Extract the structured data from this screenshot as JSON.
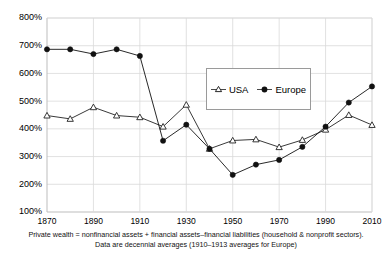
{
  "chart_data": {
    "type": "line",
    "title": "",
    "subtitle": "",
    "xlabel": "",
    "ylabel": "",
    "x": [
      1870,
      1880,
      1890,
      1900,
      1910,
      1920,
      1930,
      1940,
      1950,
      1960,
      1970,
      1980,
      1990,
      2000,
      2010
    ],
    "xtick_labels": [
      "1870",
      "1890",
      "1910",
      "1930",
      "1950",
      "1970",
      "1990",
      "2010"
    ],
    "xtick_values": [
      1870,
      1890,
      1910,
      1930,
      1950,
      1970,
      1990,
      2010
    ],
    "xlim": [
      1870,
      2010
    ],
    "ytick_labels": [
      "100%",
      "200%",
      "300%",
      "400%",
      "500%",
      "600%",
      "700%",
      "800%"
    ],
    "ytick_values": [
      100,
      200,
      300,
      400,
      500,
      600,
      700,
      800
    ],
    "ylim": [
      100,
      800
    ],
    "grid": true,
    "legend_position": "upper-right-inside",
    "series": [
      {
        "name": "USA",
        "marker": "triangle-open",
        "color": "#222222",
        "values": [
          448,
          436,
          478,
          448,
          442,
          408,
          487,
          328,
          358,
          362,
          334,
          360,
          397,
          450,
          414
        ]
      },
      {
        "name": "Europe",
        "marker": "circle-filled",
        "color": "#111111",
        "values": [
          687,
          687,
          670,
          687,
          663,
          357,
          415,
          328,
          234,
          271,
          288,
          335,
          408,
          495,
          553
        ]
      }
    ],
    "annotations": [
      "Private wealth = nonfinancial assets + financial assets–financial liabilities (household & nonprofit sectors).",
      "Data are decennial averages (1910–1913 averages for Europe)"
    ]
  },
  "legend": {
    "usa_label": "USA",
    "europe_label": "Europe"
  },
  "caption": {
    "line1": "Private wealth = nonfinancial assets + financial assets–financial liabilities (household & nonprofit sectors).",
    "line2": "Data are decennial averages (1910–1913 averages for Europe)"
  },
  "colors": {
    "grid": "#d9d9d9",
    "axis": "#bdbdbd",
    "series_usa": "#222222",
    "series_europe": "#111111",
    "background": "#ffffff"
  }
}
